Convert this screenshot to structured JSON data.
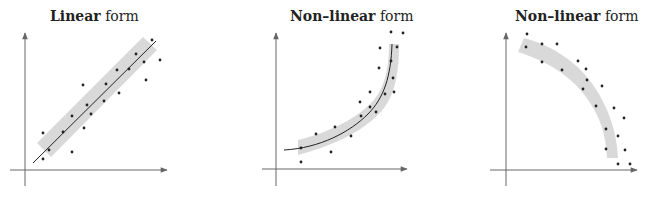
{
  "panels": [
    {
      "title_bold": "Linear",
      "title_rest": " form"
    },
    {
      "title_bold": "Non–linear",
      "title_rest": " form"
    },
    {
      "title_bold": "Non–linear",
      "title_rest": " form"
    }
  ],
  "colors": {
    "band": "#d9d9d9",
    "axis": "#666666",
    "line": "#222222",
    "dot": "#222222"
  }
}
